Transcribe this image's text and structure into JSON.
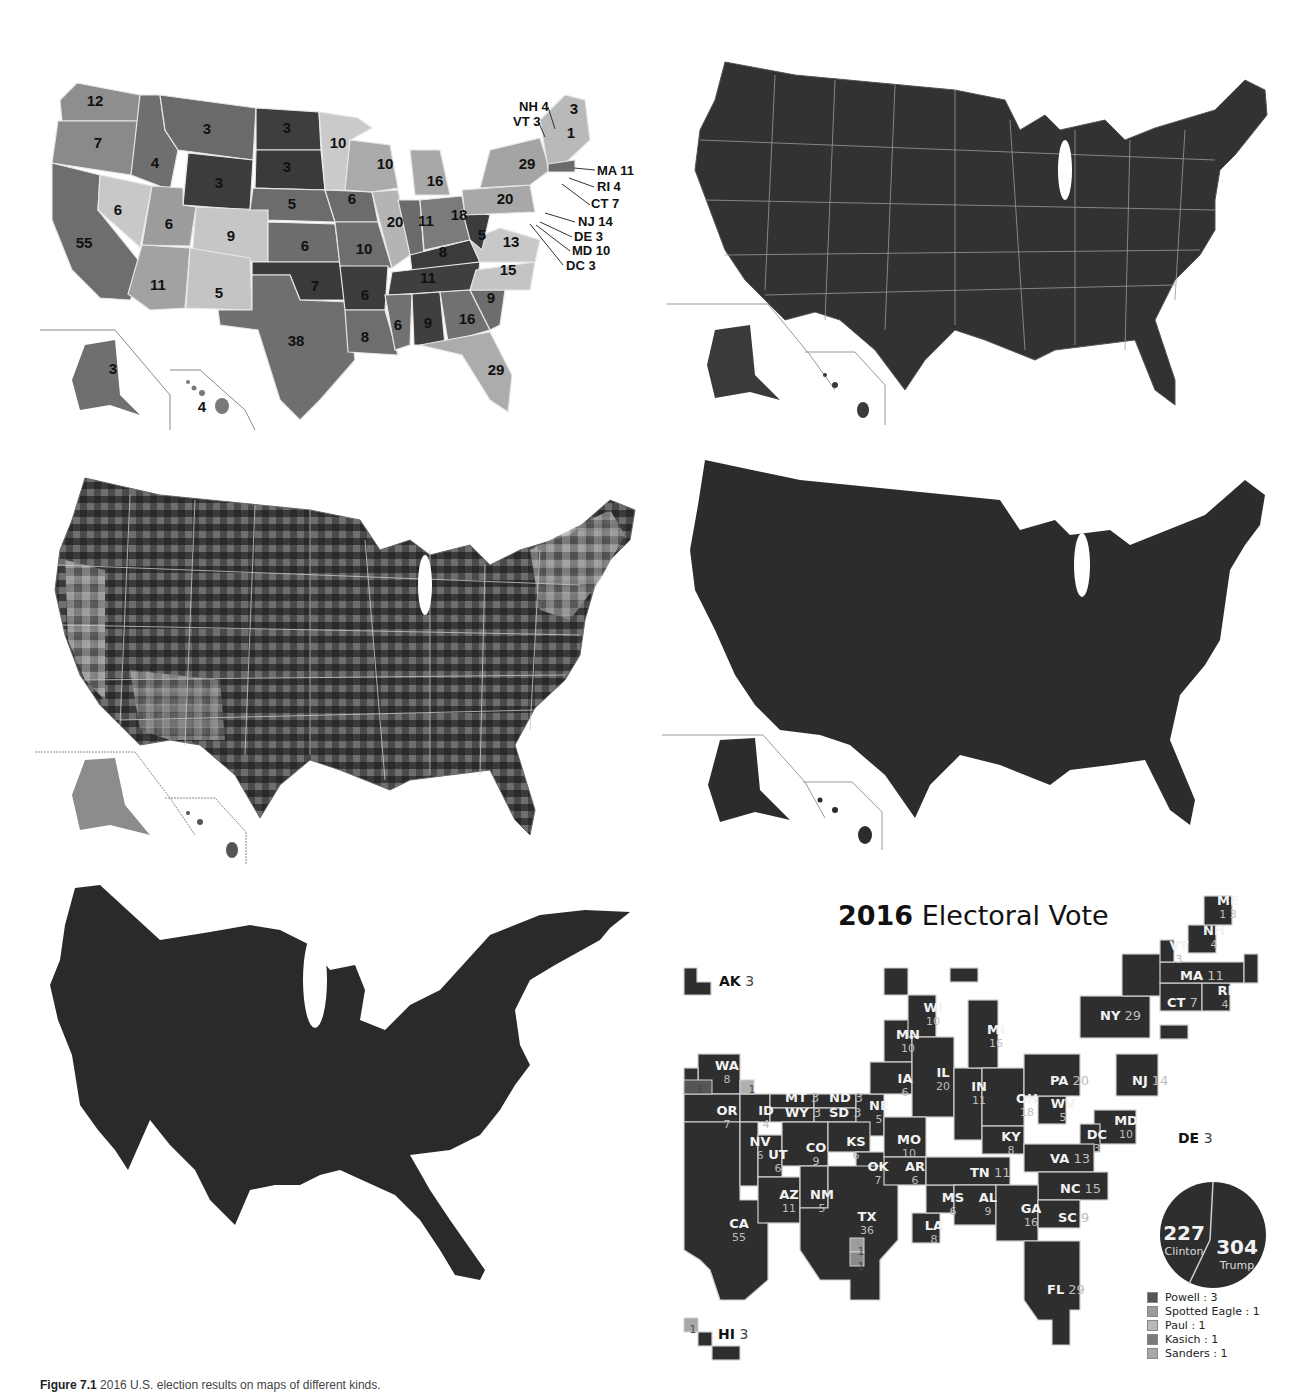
{
  "figure": {
    "caption_label": "Figure 7.1",
    "caption_text": "2016 U.S. election results on maps of different kinds."
  },
  "panels": [
    {
      "id": "state-electoral-votes",
      "position": "top-left",
      "description": "US state map shaded in grays with electoral vote counts"
    },
    {
      "id": "county-results",
      "position": "top-right",
      "description": "US county-level results, dark with light state borders"
    },
    {
      "id": "county-shaded",
      "position": "middle-left",
      "description": "US county-level results with varied gray shading"
    },
    {
      "id": "solid-map",
      "position": "middle-right",
      "description": "US map in solid dark fill"
    },
    {
      "id": "cartogram",
      "position": "bottom-left",
      "description": "Population-distorted cartogram of the US"
    },
    {
      "id": "tile-cartogram",
      "position": "bottom-right",
      "description": "2016 Electoral Vote tile cartogram"
    }
  ],
  "state_map": {
    "labels": [
      {
        "text": "12",
        "x": 95,
        "y": 106
      },
      {
        "text": "7",
        "x": 98,
        "y": 148
      },
      {
        "text": "4",
        "x": 155,
        "y": 168
      },
      {
        "text": "3",
        "x": 207,
        "y": 134
      },
      {
        "text": "3",
        "x": 287,
        "y": 133
      },
      {
        "text": "3",
        "x": 287,
        "y": 172
      },
      {
        "text": "3",
        "x": 219,
        "y": 188
      },
      {
        "text": "10",
        "x": 338,
        "y": 148
      },
      {
        "text": "10",
        "x": 385,
        "y": 169
      },
      {
        "text": "16",
        "x": 435,
        "y": 186
      },
      {
        "text": "6",
        "x": 118,
        "y": 215
      },
      {
        "text": "6",
        "x": 169,
        "y": 229
      },
      {
        "text": "9",
        "x": 231,
        "y": 241
      },
      {
        "text": "5",
        "x": 292,
        "y": 209
      },
      {
        "text": "6",
        "x": 352,
        "y": 204
      },
      {
        "text": "20",
        "x": 395,
        "y": 227
      },
      {
        "text": "11",
        "x": 426,
        "y": 226
      },
      {
        "text": "18",
        "x": 459,
        "y": 220
      },
      {
        "text": "20",
        "x": 505,
        "y": 204
      },
      {
        "text": "29",
        "x": 527,
        "y": 169
      },
      {
        "text": "55",
        "x": 84,
        "y": 248
      },
      {
        "text": "6",
        "x": 305,
        "y": 251
      },
      {
        "text": "10",
        "x": 364,
        "y": 254
      },
      {
        "text": "8",
        "x": 443,
        "y": 257
      },
      {
        "text": "5",
        "x": 482,
        "y": 240
      },
      {
        "text": "13",
        "x": 511,
        "y": 247
      },
      {
        "text": "11",
        "x": 158,
        "y": 290
      },
      {
        "text": "5",
        "x": 219,
        "y": 298
      },
      {
        "text": "7",
        "x": 315,
        "y": 291
      },
      {
        "text": "11",
        "x": 428,
        "y": 283
      },
      {
        "text": "15",
        "x": 508,
        "y": 275
      },
      {
        "text": "6",
        "x": 365,
        "y": 300
      },
      {
        "text": "38",
        "x": 296,
        "y": 346
      },
      {
        "text": "6",
        "x": 398,
        "y": 330
      },
      {
        "text": "9",
        "x": 428,
        "y": 328
      },
      {
        "text": "16",
        "x": 467,
        "y": 324
      },
      {
        "text": "9",
        "x": 491,
        "y": 303
      },
      {
        "text": "8",
        "x": 365,
        "y": 342
      },
      {
        "text": "29",
        "x": 496,
        "y": 375
      },
      {
        "text": "3",
        "x": 113,
        "y": 374
      },
      {
        "text": "4",
        "x": 202,
        "y": 412
      },
      {
        "text": "3",
        "x": 574,
        "y": 114
      },
      {
        "text": "1",
        "x": 571,
        "y": 138
      }
    ],
    "callouts": [
      {
        "text": "NH 4",
        "x": 519,
        "y": 111
      },
      {
        "text": "VT 3",
        "x": 513,
        "y": 126
      },
      {
        "text": "MA 11",
        "x": 597,
        "y": 175
      },
      {
        "text": "RI 4",
        "x": 597,
        "y": 191
      },
      {
        "text": "CT 7",
        "x": 591,
        "y": 208
      },
      {
        "text": "NJ 14",
        "x": 578,
        "y": 226
      },
      {
        "text": "DE 3",
        "x": 574,
        "y": 241
      },
      {
        "text": "MD 10",
        "x": 572,
        "y": 255
      },
      {
        "text": "DC 3",
        "x": 566,
        "y": 270
      }
    ]
  },
  "electoral": {
    "title_bold": "2016",
    "title_rest": " Electoral Vote",
    "tiles": [
      {
        "st": "WA",
        "n": "8",
        "x": 717,
        "y": 1067
      },
      {
        "st": "OR",
        "n": "7",
        "x": 717,
        "y": 1112
      },
      {
        "st": "ID",
        "n": "4",
        "x": 756,
        "y": 1112
      },
      {
        "st": "MT",
        "n": "3",
        "x": 785,
        "y": 1097,
        "inline": true
      },
      {
        "st": "WY",
        "n": "3",
        "x": 785,
        "y": 1112,
        "inline": true
      },
      {
        "st": "ND",
        "n": "3",
        "x": 829,
        "y": 1097,
        "inline": true
      },
      {
        "st": "SD",
        "n": "3",
        "x": 829,
        "y": 1112,
        "inline": true
      },
      {
        "st": "NE",
        "n": "5",
        "x": 869,
        "y": 1107
      },
      {
        "st": "NV",
        "n": "6",
        "x": 750,
        "y": 1143
      },
      {
        "st": "UT",
        "n": "6",
        "x": 768,
        "y": 1156
      },
      {
        "st": "CO",
        "n": "9",
        "x": 806,
        "y": 1149
      },
      {
        "st": "KS",
        "n": "6",
        "x": 846,
        "y": 1143
      },
      {
        "st": "MO",
        "n": "10",
        "x": 899,
        "y": 1141
      },
      {
        "st": "OK",
        "n": "7",
        "x": 868,
        "y": 1168
      },
      {
        "st": "AR",
        "n": "6",
        "x": 905,
        "y": 1168
      },
      {
        "st": "AZ",
        "n": "11",
        "x": 779,
        "y": 1196
      },
      {
        "st": "NM",
        "n": "5",
        "x": 812,
        "y": 1196
      },
      {
        "st": "TX",
        "n": "36",
        "x": 857,
        "y": 1218
      },
      {
        "st": "CA",
        "n": "55",
        "x": 729,
        "y": 1225
      },
      {
        "st": "LA",
        "n": "8",
        "x": 924,
        "y": 1227
      },
      {
        "st": "MS",
        "n": "6",
        "x": 943,
        "y": 1199
      },
      {
        "st": "AL",
        "n": "9",
        "x": 978,
        "y": 1199
      },
      {
        "st": "TN",
        "n": "11",
        "x": 970,
        "y": 1172,
        "inline": true
      },
      {
        "st": "IA",
        "n": "6",
        "x": 895,
        "y": 1080
      },
      {
        "st": "MN",
        "n": "10",
        "x": 898,
        "y": 1036
      },
      {
        "st": "WI",
        "n": "10",
        "x": 923,
        "y": 1009
      },
      {
        "st": "IL",
        "n": "20",
        "x": 933,
        "y": 1074
      },
      {
        "st": "IN",
        "n": "11",
        "x": 969,
        "y": 1088
      },
      {
        "st": "MI",
        "n": "16",
        "x": 986,
        "y": 1031
      },
      {
        "st": "OH",
        "n": "18",
        "x": 1017,
        "y": 1100
      },
      {
        "st": "KY",
        "n": "8",
        "x": 1001,
        "y": 1138
      },
      {
        "st": "WV",
        "n": "5",
        "x": 1053,
        "y": 1105
      },
      {
        "st": "PA",
        "n": "20",
        "x": 1050,
        "y": 1080,
        "inline": true
      },
      {
        "st": "NJ",
        "n": "14",
        "x": 1132,
        "y": 1080,
        "inline": true
      },
      {
        "st": "MD",
        "n": "10",
        "x": 1116,
        "y": 1122
      },
      {
        "st": "DC",
        "n": "3",
        "x": 1087,
        "y": 1136
      },
      {
        "st": "VA",
        "n": "13",
        "x": 1050,
        "y": 1158,
        "inline": true
      },
      {
        "st": "NC",
        "n": "15",
        "x": 1060,
        "y": 1188,
        "inline": true
      },
      {
        "st": "GA",
        "n": "16",
        "x": 1021,
        "y": 1210
      },
      {
        "st": "SC",
        "n": "9",
        "x": 1058,
        "y": 1217,
        "inline": true
      },
      {
        "st": "FL",
        "n": "29",
        "x": 1047,
        "y": 1289,
        "inline": true
      },
      {
        "st": "NY",
        "n": "29",
        "x": 1100,
        "y": 1015,
        "inline": true
      },
      {
        "st": "CT",
        "n": "7",
        "x": 1167,
        "y": 1002,
        "inline": true
      },
      {
        "st": "RI",
        "n": "4",
        "x": 1215,
        "y": 992
      },
      {
        "st": "MA",
        "n": "11",
        "x": 1180,
        "y": 975,
        "inline": true
      },
      {
        "st": "VT",
        "n": "3",
        "x": 1169,
        "y": 947
      },
      {
        "st": "NH",
        "n": "4",
        "x": 1204,
        "y": 932
      },
      {
        "st": "ME",
        "n": "1 3",
        "x": 1218,
        "y": 902
      }
    ],
    "external_labels": [
      {
        "st": "AK",
        "n": "3",
        "x": 719,
        "y": 986
      },
      {
        "st": "DE",
        "n": "3",
        "x": 1178,
        "y": 1143
      },
      {
        "st": "HI",
        "n": "3",
        "x": 718,
        "y": 1339
      }
    ],
    "faithless_tiles": [
      {
        "value": "3",
        "x": 695,
        "y": 1083
      },
      {
        "value": "1",
        "x": 747,
        "y": 1083
      },
      {
        "value": "1",
        "x": 856,
        "y": 1245
      },
      {
        "value": "1",
        "x": 856,
        "y": 1260
      },
      {
        "value": "1",
        "x": 688,
        "y": 1323
      }
    ],
    "pie": {
      "clinton_votes": "227",
      "clinton_label": "Clinton",
      "trump_votes": "304",
      "trump_label": "Trump"
    },
    "legend": [
      {
        "label": "Powell : 3",
        "color": "#555555"
      },
      {
        "label": "Spotted Eagle : 1",
        "color": "#9a9a9a"
      },
      {
        "label": "Paul : 1",
        "color": "#b8b8b8"
      },
      {
        "label": "Kasich : 1",
        "color": "#7a7a7a"
      },
      {
        "label": "Sanders : 1",
        "color": "#a8a8a8"
      }
    ]
  },
  "colors": {
    "dark_fill": "#2f2f2f",
    "mid_fill": "#6b6b6b",
    "light_fill": "#bdbdbd",
    "border": "#cfcfcf"
  }
}
